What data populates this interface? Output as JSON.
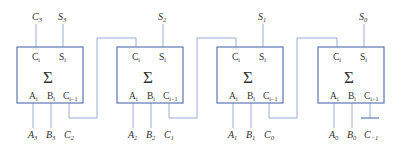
{
  "diagram": {
    "colors": {
      "box_stroke": "#5b77b3",
      "wire": "#8ea4cf",
      "text": "#333333"
    },
    "symbol": "Σ",
    "pins": {
      "carry_out": "C",
      "carry_out_sub": "i",
      "sum": "S",
      "sum_sub": "i",
      "a": "A",
      "a_sub": "i",
      "b": "B",
      "b_sub": "i",
      "carry_in": "C",
      "carry_in_sub": "i−1"
    },
    "adders": [
      {
        "index": 3,
        "carry_out_label": "C",
        "carry_out_sub": "3",
        "sum_label": "S",
        "sum_sub": "3",
        "a_label": "A",
        "a_sub": "3",
        "b_label": "B",
        "b_sub": "3",
        "carry_in_label": "C",
        "carry_in_sub": "2"
      },
      {
        "index": 2,
        "sum_label": "S",
        "sum_sub": "2",
        "a_label": "A",
        "a_sub": "2",
        "b_label": "B",
        "b_sub": "2",
        "carry_in_label": "C",
        "carry_in_sub": "1"
      },
      {
        "index": 1,
        "sum_label": "S",
        "sum_sub": "1",
        "a_label": "A",
        "a_sub": "1",
        "b_label": "B",
        "b_sub": "1",
        "carry_in_label": "C",
        "carry_in_sub": "0"
      },
      {
        "index": 0,
        "sum_label": "S",
        "sum_sub": "0",
        "a_label": "A",
        "a_sub": "0",
        "b_label": "B",
        "b_sub": "0",
        "carry_in_label": "C",
        "carry_in_sub": "−1"
      }
    ]
  }
}
